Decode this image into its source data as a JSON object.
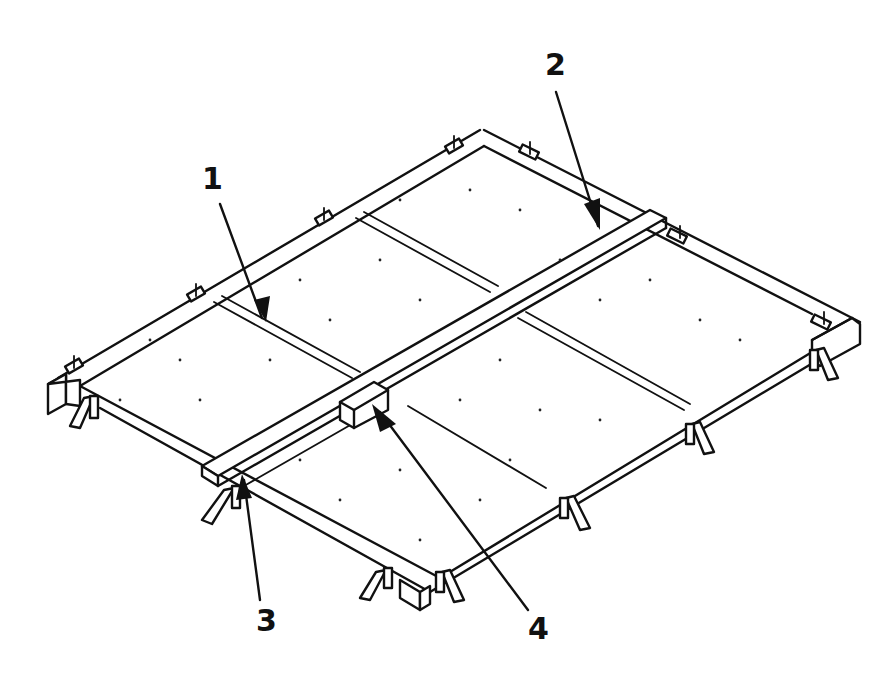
{
  "figure": {
    "line_color": "#111111",
    "background": "#ffffff"
  },
  "callouts": [
    {
      "id": 1,
      "label": "1",
      "target": "panel-divider-strip"
    },
    {
      "id": 2,
      "label": "2",
      "target": "center-beam"
    },
    {
      "id": 3,
      "label": "3",
      "target": "end-support-wedge"
    },
    {
      "id": 4,
      "label": "4",
      "target": "center-bracket"
    }
  ]
}
